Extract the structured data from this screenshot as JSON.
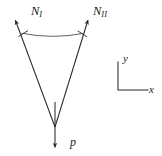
{
  "figure": {
    "title": "",
    "background_color": "#ffffff",
    "stroke_color": "#2a2a2a",
    "labels": {
      "force_left": {
        "base": "N",
        "subscript": "I"
      },
      "force_right": {
        "base": "N",
        "subscript": "II"
      },
      "load": "p",
      "axis_y": "y",
      "axis_x": "x"
    },
    "geometry": {
      "apex": {
        "x": 55,
        "y": 127
      },
      "left_arrow_tip": {
        "x": 13,
        "y": 17
      },
      "right_arrow_tip": {
        "x": 90,
        "y": 17
      },
      "load_arrow_tip": {
        "x": 55,
        "y": 150
      },
      "chord_left": {
        "x": 24,
        "y": 35
      },
      "chord_right": {
        "x": 81,
        "y": 35
      },
      "chord_sag": 3,
      "axes_corner": {
        "x": 118,
        "y": 90
      },
      "axes_y_top": {
        "x": 118,
        "y": 62
      },
      "axes_x_right": {
        "x": 148,
        "y": 90
      }
    }
  }
}
